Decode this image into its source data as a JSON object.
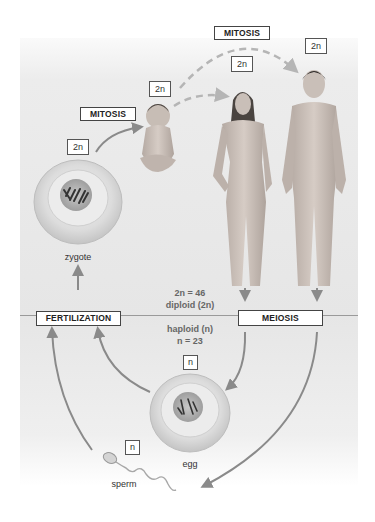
{
  "diagram": {
    "stages": {
      "zygote": {
        "label": "zygote",
        "ploidy": "2n"
      },
      "baby": {
        "ploidy": "2n"
      },
      "female_adult": {
        "ploidy": "2n"
      },
      "male_adult": {
        "ploidy": "2n"
      },
      "egg": {
        "label": "egg",
        "ploidy": "n"
      },
      "sperm": {
        "label": "sperm",
        "ploidy": "n"
      }
    },
    "processes": {
      "mitosis_zygote_to_baby": "MITOSIS",
      "mitosis_baby_to_adults": "MITOSIS",
      "meiosis": "MEIOSIS",
      "fertilization": "FERTILIZATION"
    },
    "divider": {
      "diploid_line1": "2n = 46",
      "diploid_line2": "diploid (2n)",
      "haploid_line1": "haploid (n)",
      "haploid_line2": "n = 23"
    },
    "colors": {
      "arrow": "#8a8a8a",
      "dashed_arrow": "#b5b5b5",
      "upper_band": "#e9e9e9",
      "lower_band": "#ececec",
      "divider_line": "#9a9a9a",
      "skin": "#c9bfb8"
    }
  }
}
